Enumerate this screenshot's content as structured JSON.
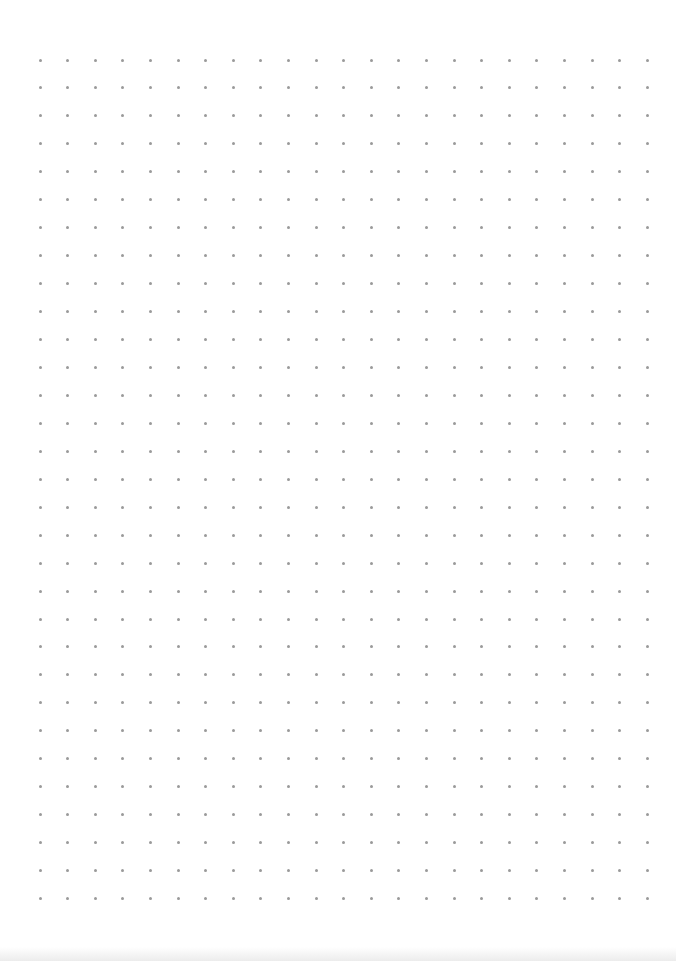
{
  "page": {
    "type": "dot-grid-paper",
    "background_color": "#ffffff",
    "dot_color": "#9a9a9a"
  },
  "grid": {
    "columns": 23,
    "rows": 31,
    "origin_x": 40,
    "origin_y": 60,
    "spacing_x": 27.6,
    "spacing_y": 27.95,
    "dot_size": 3
  }
}
